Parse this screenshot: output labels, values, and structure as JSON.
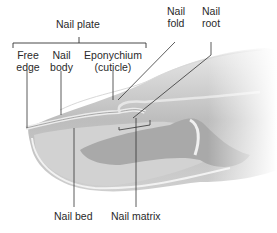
{
  "diagram": {
    "labels": {
      "nail_plate": "Nail plate",
      "free_edge_1": "Free",
      "free_edge_2": "edge",
      "nail_body_1": "Nail",
      "nail_body_2": "body",
      "eponychium_1": "Eponychium",
      "eponychium_2": "(cuticle)",
      "nail_fold_1": "Nail",
      "nail_fold_2": "fold",
      "nail_root_1": "Nail",
      "nail_root_2": "root",
      "nail_bed": "Nail bed",
      "nail_matrix": "Nail matrix"
    }
  }
}
